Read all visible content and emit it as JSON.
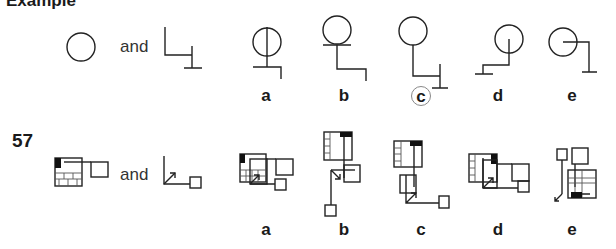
{
  "header": {
    "cut_title": "Example"
  },
  "example": {
    "and_label": "and",
    "options": [
      {
        "label": "a",
        "correct": false
      },
      {
        "label": "b",
        "correct": false
      },
      {
        "label": "c",
        "correct": true
      },
      {
        "label": "d",
        "correct": false
      },
      {
        "label": "e",
        "correct": false
      }
    ]
  },
  "question": {
    "number": "57",
    "and_label": "and",
    "options": [
      {
        "label": "a"
      },
      {
        "label": "b"
      },
      {
        "label": "c"
      },
      {
        "label": "d"
      },
      {
        "label": "e"
      }
    ]
  },
  "colors": {
    "stroke": "#222222",
    "circle_marker": "#888888",
    "background": "#ffffff"
  }
}
